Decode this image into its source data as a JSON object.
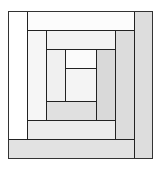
{
  "diagram": {
    "title": "",
    "type": "log-cabin-quilt-block",
    "line_color": "#222222",
    "pieces": [
      {
        "id": "outer-left",
        "x": 8,
        "y": 11,
        "w": 19,
        "h": 128,
        "color": "#ffffff"
      },
      {
        "id": "outer-top",
        "x": 27,
        "y": 11,
        "w": 107,
        "h": 19,
        "color": "#fcfcfc"
      },
      {
        "id": "outer-right",
        "x": 134,
        "y": 11,
        "w": 18,
        "h": 147,
        "color": "#dddddd"
      },
      {
        "id": "outer-bottom",
        "x": 8,
        "y": 139,
        "w": 126,
        "h": 19,
        "color": "#e2e2e2"
      },
      {
        "id": "middle-left",
        "x": 27,
        "y": 30,
        "w": 19,
        "h": 90,
        "color": "#f6f6f6"
      },
      {
        "id": "middle-top",
        "x": 46,
        "y": 30,
        "w": 69,
        "h": 19,
        "color": "#f2f2f2"
      },
      {
        "id": "middle-right",
        "x": 115,
        "y": 30,
        "w": 19,
        "h": 109,
        "color": "#dcdcdc"
      },
      {
        "id": "middle-bottom",
        "x": 27,
        "y": 120,
        "w": 88,
        "h": 19,
        "color": "#ebebeb"
      },
      {
        "id": "inner-left",
        "x": 46,
        "y": 49,
        "w": 19,
        "h": 52,
        "color": "#f0f0f0"
      },
      {
        "id": "inner-top",
        "x": 65,
        "y": 49,
        "w": 31,
        "h": 19,
        "color": "#fbfbfb"
      },
      {
        "id": "inner-right",
        "x": 96,
        "y": 49,
        "w": 19,
        "h": 71,
        "color": "#d9d9d9"
      },
      {
        "id": "inner-bottom",
        "x": 46,
        "y": 101,
        "w": 50,
        "h": 19,
        "color": "#e0e0e0"
      },
      {
        "id": "center",
        "x": 65,
        "y": 68,
        "w": 31,
        "h": 33,
        "color": "#f4f4f4"
      }
    ]
  }
}
